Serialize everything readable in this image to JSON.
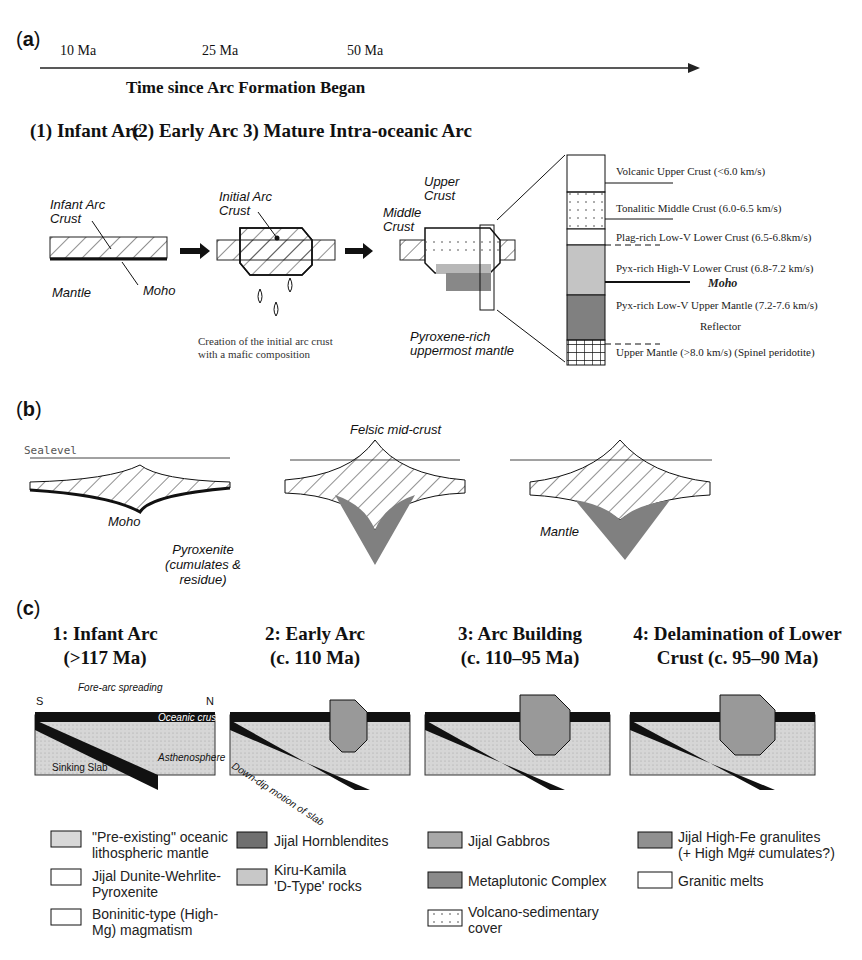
{
  "panel_a": {
    "label": "a",
    "timeline": {
      "ticks": [
        "10 Ma",
        "25 Ma",
        "50 Ma"
      ],
      "axis_title": "Time since Arc Formation Began"
    },
    "stages": [
      {
        "title": "(1) Infant Arc",
        "labels": [
          "Infant Arc Crust",
          "Moho",
          "Mantle"
        ]
      },
      {
        "title": "(2) Early Arc",
        "labels": [
          "Initial Arc Crust"
        ],
        "caption": [
          "Creation of the initial arc crust",
          "with a mafic composition"
        ]
      },
      {
        "title": "3) Mature Intra-oceanic Arc",
        "labels": [
          "Upper Crust",
          "Middle Crust",
          "Pyroxene-rich",
          "uppermost mantle"
        ]
      }
    ],
    "column": [
      {
        "name": "Volcanic Upper Crust (<6.0 km/s)"
      },
      {
        "name": "Tonalitic Middle Crust (6.0-6.5 km/s)"
      },
      {
        "name": "Plag-rich Low-V Lower Crust (6.5-6.8km/s)"
      },
      {
        "name": "Pyx-rich High-V Lower Crust (6.8-7.2 km/s)"
      },
      {
        "name": "Moho"
      },
      {
        "name": "Pyx-rich Low-V Upper Mantle (7.2-7.6 km/s)"
      },
      {
        "name": "Reflector"
      },
      {
        "name": "Upper Mantle (>8.0 km/s) (Spinel peridotite)"
      }
    ]
  },
  "panel_b": {
    "label": "b",
    "sealevel": "Sealevel",
    "labels": [
      "Moho",
      "Felsic mid-crust",
      "Pyroxenite",
      "(cumulates & residue)",
      "Mantle"
    ]
  },
  "panel_c": {
    "label": "c",
    "stages": [
      {
        "line1": "1: Infant Arc",
        "line2": "(>117 Ma)"
      },
      {
        "line1": "2: Early Arc",
        "line2": "(c. 110 Ma)"
      },
      {
        "line1": "3: Arc Building",
        "line2": "(c. 110–95 Ma)"
      },
      {
        "line1": "4:  Delamination of Lower",
        "line2": "Crust (c. 95–90 Ma)"
      }
    ],
    "labels": {
      "fore_arc": "Fore-arc spreading",
      "south": "S",
      "north": "N",
      "oceanic_crust": "Oceanic crust",
      "asthenosphere": "Asthenosphere",
      "sinking_slab": "Sinking Slab",
      "down_dip": "Down-dip motion of slab"
    },
    "legend": [
      {
        "text": "\"Pre-existing\" oceanic lithospheric mantle",
        "l1": "\"Pre-existing\" oceanic",
        "l2": "lithospheric mantle"
      },
      {
        "text": "Jijal Dunite-Wehrlite-Pyroxenite",
        "l1": "Jijal Dunite-Wehrlite-",
        "l2": "Pyroxenite"
      },
      {
        "text": "Boninitic-type (High-Mg) magmatism",
        "l1": "Boninitic-type (High-",
        "l2": "Mg) magmatism"
      },
      {
        "text": "Jijal Hornblendites",
        "l1": "Jijal Hornblendites",
        "l2": ""
      },
      {
        "text": "Kiru-Kamila 'D-Type' rocks",
        "l1": "Kiru-Kamila",
        "l2": "'D-Type' rocks"
      },
      {
        "text": "Jijal Gabbros",
        "l1": "Jijal Gabbros",
        "l2": ""
      },
      {
        "text": "Metaplutonic Complex",
        "l1": "Metaplutonic Complex",
        "l2": ""
      },
      {
        "text": "Volcano-sedimentary cover",
        "l1": "Volcano-sedimentary",
        "l2": "cover"
      },
      {
        "text": "Jijal High-Fe granulites (+ High Mg# cumulates?)",
        "l1": "Jijal High-Fe granulites",
        "l2": "(+ High Mg# cumulates?)"
      },
      {
        "text": "Granitic melts",
        "l1": "Granitic melts",
        "l2": ""
      }
    ]
  },
  "colors": {
    "ink": "#111111",
    "light_gray": "#d4d4d4",
    "mid_gray": "#a8a8a8",
    "dark_gray": "#707070"
  }
}
